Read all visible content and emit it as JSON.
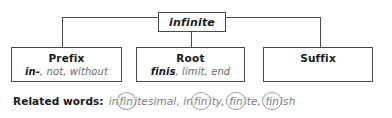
{
  "diagram": {
    "title": "infinite",
    "root_word": "infinite",
    "nodes": [
      {
        "id": "prefix",
        "title": "Prefix",
        "term": "in-",
        "meaning": ", not, without"
      },
      {
        "id": "root",
        "title": "Root",
        "term": "finis",
        "meaning": ", limit, end"
      },
      {
        "id": "suffix",
        "title": "Suffix",
        "term": "",
        "meaning": ""
      }
    ]
  },
  "related": {
    "label": "Related words:",
    "words_text": "infinitesimal, infinity, finite, finish",
    "segments": [
      {
        "text": "in",
        "circled": false
      },
      {
        "text": "fin",
        "circled": true
      },
      {
        "text": "itesimal, in",
        "circled": false
      },
      {
        "text": "fin",
        "circled": true
      },
      {
        "text": "ity, ",
        "circled": false
      },
      {
        "text": "fin",
        "circled": true
      },
      {
        "text": "ite, ",
        "circled": false
      },
      {
        "text": "fin",
        "circled": true
      },
      {
        "text": "ish",
        "circled": false
      }
    ]
  },
  "colors": {
    "line": "#4a4a4a",
    "text_dark": "#1a1a1a",
    "text_gray": "#6b6b6b",
    "circle": "#9a9a9a",
    "background": "#ffffff"
  }
}
